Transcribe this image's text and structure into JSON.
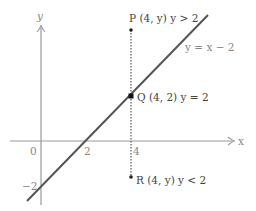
{
  "diagram": {
    "axes": {
      "x_label": "x",
      "y_label": "y",
      "origin_label": "0",
      "x_tick_2": "2",
      "x_tick_4": "4",
      "y_tick_neg2": "−2"
    },
    "line": {
      "equation": "y = x − 2",
      "color": "#555555"
    },
    "points": [
      {
        "name": "P",
        "label": "P (4, y) y > 2",
        "x": 4,
        "y": 5
      },
      {
        "name": "Q",
        "label": "Q (4, 2) y = 2",
        "x": 4,
        "y": 2
      },
      {
        "name": "R",
        "label": "R (4, y) y < 2",
        "x": 4,
        "y": -1.5
      }
    ],
    "vertical_line": {
      "x": 4,
      "style": "dotted"
    }
  }
}
